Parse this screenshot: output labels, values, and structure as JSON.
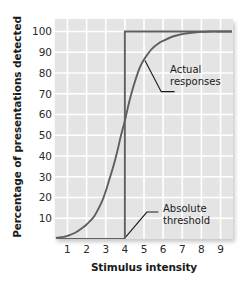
{
  "chart_data": {
    "type": "line",
    "title": "",
    "xlabel": "Stimulus intensity",
    "ylabel": "Percentage of presentations detected",
    "xlim": [
      0.35,
      9.65
    ],
    "ylim": [
      0,
      106
    ],
    "grid": true,
    "legend_position": "none",
    "xticks": [
      "1",
      "2",
      "3",
      "4",
      "5",
      "6",
      "7",
      "8",
      "9"
    ],
    "xtick_values": [
      1,
      2,
      3,
      4,
      5,
      6,
      7,
      8,
      9
    ],
    "yticks": [
      "10",
      "20",
      "30",
      "40",
      "50",
      "60",
      "70",
      "80",
      "90",
      "100"
    ],
    "ytick_values": [
      10,
      20,
      30,
      40,
      50,
      60,
      70,
      80,
      90,
      100
    ],
    "series": [
      {
        "name": "Actual responses",
        "style": "sigmoid-curve",
        "color": "#5f5f5f",
        "x": [
          0.4,
          0.8,
          1.0,
          1.4,
          1.8,
          2.0,
          2.4,
          2.8,
          3.0,
          3.2,
          3.4,
          3.6,
          3.8,
          4.0,
          4.2,
          4.4,
          4.6,
          4.8,
          5.0,
          5.4,
          5.8,
          6.0,
          6.4,
          6.8,
          7.0,
          7.5,
          8.0,
          8.5,
          9.0,
          9.6
        ],
        "values": [
          0.5,
          1.0,
          1.5,
          3.0,
          5.5,
          7.0,
          11.0,
          18.0,
          23.0,
          29.0,
          35.0,
          42.0,
          50.0,
          57.0,
          65.0,
          72.0,
          78.0,
          83.0,
          86.5,
          91.5,
          94.5,
          95.5,
          97.2,
          98.3,
          98.7,
          99.4,
          99.8,
          100.0,
          100.0,
          100.0
        ]
      },
      {
        "name": "Absolute threshold",
        "style": "step",
        "color": "#5f5f5f",
        "x": [
          0.4,
          4.0,
          4.0,
          9.6
        ],
        "values": [
          0,
          0,
          100,
          100
        ]
      }
    ],
    "annotations": [
      {
        "name": "actual-responses",
        "text": "Actual\nresponses",
        "target_x": 5.05,
        "target_y": 86
      },
      {
        "name": "absolute-threshold",
        "text": "Absolute\nthreshold",
        "target_x": 4.0,
        "target_y": 1
      }
    ]
  },
  "colors": {
    "panel_background": "#e4e4e4",
    "gridline": "#ffffff",
    "curve": "#5f5f5f",
    "text": "#1a1a1a",
    "page_background": "#ffffff"
  }
}
